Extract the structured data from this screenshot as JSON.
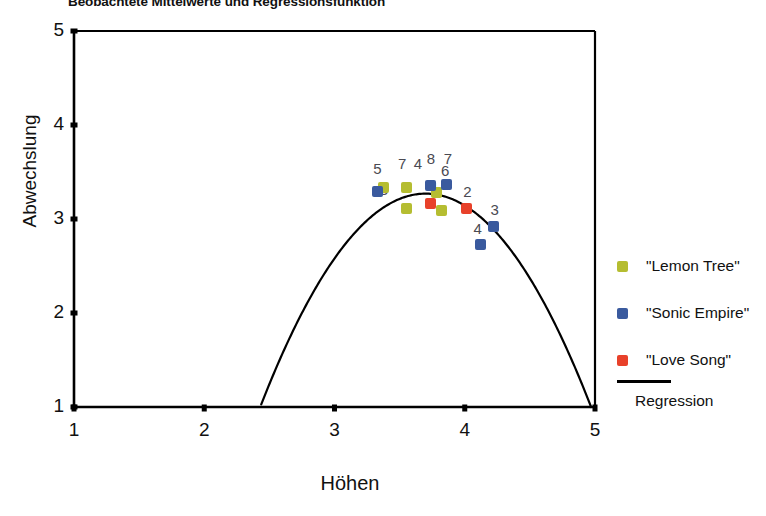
{
  "chart_data": {
    "type": "scatter",
    "title": "Beobachtete Mittelwerte und Regressionsfunktion",
    "xlabel": "Höhen",
    "ylabel": "Abwechslung",
    "xlim": [
      1,
      5
    ],
    "ylim": [
      1,
      5
    ],
    "xticks": [
      "1",
      "2",
      "3",
      "4",
      "5"
    ],
    "yticks": [
      "1",
      "2",
      "3",
      "4",
      "5"
    ],
    "grid": false,
    "legend_position": "right",
    "series": [
      {
        "name": "\"Lemon Tree\"",
        "color": "#b5bd31",
        "points": [
          {
            "label": "3",
            "x": 3.38,
            "y": 3.33
          },
          {
            "label": "7",
            "x": 3.55,
            "y": 3.34
          },
          {
            "label": "8",
            "x": 3.55,
            "y": 3.11
          },
          {
            "label": "4",
            "x": 3.78,
            "y": 3.28
          },
          {
            "label": "6",
            "x": 3.82,
            "y": 3.09
          }
        ]
      },
      {
        "name": "\"Sonic Empire\"",
        "color": "#3a5a9e",
        "points": [
          {
            "label": "5",
            "x": 3.33,
            "y": 3.29
          },
          {
            "label": "8",
            "x": 3.74,
            "y": 3.36
          },
          {
            "label": "7",
            "x": 3.86,
            "y": 3.37
          },
          {
            "label": "3",
            "x": 4.22,
            "y": 2.92
          },
          {
            "label": "4",
            "x": 4.12,
            "y": 2.73
          }
        ]
      },
      {
        "name": "\"Love Song\"",
        "color": "#e8412a",
        "points": [
          {
            "label": "4",
            "x": 3.74,
            "y": 3.17
          },
          {
            "label": "2",
            "x": 4.01,
            "y": 3.11
          }
        ]
      }
    ],
    "regression": {
      "name": "Regression",
      "color": "#000000",
      "type": "quadratic",
      "vertex": {
        "x": 3.7,
        "y": 3.27
      },
      "x_start": 2.18,
      "x_end": 4.97,
      "y_at_ends": 1.0
    },
    "point_labels": [
      {
        "text": "5",
        "x": 3.33,
        "y": 3.52
      },
      {
        "text": "3",
        "x": 3.38,
        "y": 3.3
      },
      {
        "text": "7",
        "x": 3.52,
        "y": 3.57
      },
      {
        "text": "4",
        "x": 3.64,
        "y": 3.57
      },
      {
        "text": "8",
        "x": 3.74,
        "y": 3.63
      },
      {
        "text": "7",
        "x": 3.87,
        "y": 3.63
      },
      {
        "text": "6",
        "x": 3.85,
        "y": 3.5
      },
      {
        "text": "4",
        "x": 3.76,
        "y": 3.32
      },
      {
        "text": "2",
        "x": 4.02,
        "y": 3.28
      },
      {
        "text": "3",
        "x": 4.23,
        "y": 3.08
      },
      {
        "text": "4",
        "x": 4.1,
        "y": 2.88
      }
    ]
  },
  "legend": {
    "entries": [
      {
        "label": "\"Lemon Tree\"",
        "color": "#b5bd31"
      },
      {
        "label": "\"Sonic Empire\"",
        "color": "#3a5a9e"
      },
      {
        "label": "\"Love Song\"",
        "color": "#e8412a"
      }
    ],
    "line_label": "Regression"
  }
}
